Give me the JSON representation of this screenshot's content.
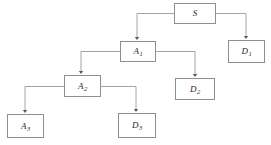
{
  "diagram": {
    "canvas": {
      "width": 271,
      "height": 145,
      "background": "#ffffff"
    },
    "style": {
      "node_border_color": "#8f8f8f",
      "node_fill_color": "#ffffff",
      "edge_color": "#9a9a9a",
      "label_color": "#2a2a2a"
    },
    "nodes": [
      {
        "id": "S",
        "base": "S",
        "sub": "",
        "x": 174,
        "y": 3,
        "w": 42,
        "h": 21
      },
      {
        "id": "D1",
        "base": "D",
        "sub": "1",
        "x": 228,
        "y": 40,
        "w": 37,
        "h": 23
      },
      {
        "id": "A1",
        "base": "A",
        "sub": "1",
        "x": 120,
        "y": 41,
        "w": 36,
        "h": 21
      },
      {
        "id": "D2",
        "base": "D",
        "sub": "2",
        "x": 175,
        "y": 78,
        "w": 40,
        "h": 22
      },
      {
        "id": "A2",
        "base": "A",
        "sub": "2",
        "x": 64,
        "y": 75,
        "w": 37,
        "h": 22
      },
      {
        "id": "A3",
        "base": "A",
        "sub": "3",
        "x": 7,
        "y": 114,
        "w": 37,
        "h": 24
      },
      {
        "id": "D3",
        "base": "D",
        "sub": "3",
        "x": 118,
        "y": 113,
        "w": 38,
        "h": 25
      }
    ],
    "edges": [
      {
        "id": "edge-s-to-a1",
        "from": "S",
        "to": "A1",
        "direction": "left-down"
      },
      {
        "id": "edge-s-to-d1",
        "from": "S",
        "to": "D1",
        "direction": "right-down"
      },
      {
        "id": "edge-a1-to-a2",
        "from": "A1",
        "to": "A2",
        "direction": "left-down"
      },
      {
        "id": "edge-a1-to-d2",
        "from": "A1",
        "to": "D2",
        "direction": "right-down"
      },
      {
        "id": "edge-a2-to-a3",
        "from": "A2",
        "to": "A3",
        "direction": "left-down"
      },
      {
        "id": "edge-a2-to-d3",
        "from": "A2",
        "to": "D3",
        "direction": "right-down"
      }
    ]
  }
}
